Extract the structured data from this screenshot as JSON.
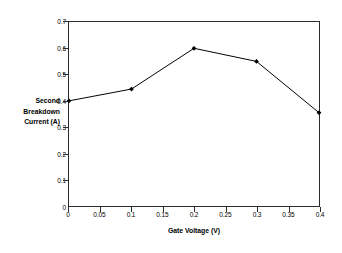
{
  "chart_data": {
    "type": "line",
    "title": "",
    "xlabel": "Gate Voltage (V)",
    "ylabel": "Second Breakdown Current (A)",
    "ylabel_lines": [
      "Second",
      "Breakdown",
      "Current (A)"
    ],
    "x": [
      0,
      0.1,
      0.2,
      0.3,
      0.4
    ],
    "values": [
      0.4,
      0.445,
      0.6,
      0.55,
      0.355
    ],
    "series": [
      {
        "name": "Second Breakdown Current",
        "x": [
          0,
          0.1,
          0.2,
          0.3,
          0.4
        ],
        "values": [
          0.4,
          0.445,
          0.6,
          0.55,
          0.355
        ]
      }
    ],
    "xlim": [
      0,
      0.4
    ],
    "ylim": [
      0,
      0.7
    ],
    "xticks": [
      0,
      0.05,
      0.1,
      0.15,
      0.2,
      0.25,
      0.3,
      0.35,
      0.4
    ],
    "xtick_labels": [
      "0",
      "0.05",
      "0.1",
      "0.15",
      "0.2",
      "0.25",
      "0.3",
      "0.35",
      "0.4"
    ],
    "yticks": [
      0,
      0.1,
      0.2,
      0.3,
      0.4,
      0.5,
      0.6,
      0.7
    ],
    "ytick_labels": [
      "0",
      "0.1",
      "0.2",
      "0.3",
      "0.4",
      "0.5",
      "0.6",
      "0.7"
    ],
    "grid": false,
    "legend": false,
    "legend_position": "none",
    "marker": "diamond",
    "line_color": "#000000",
    "marker_color": "#000000",
    "axis_color": "#2b2b2b",
    "background_color": "#ffffff"
  }
}
